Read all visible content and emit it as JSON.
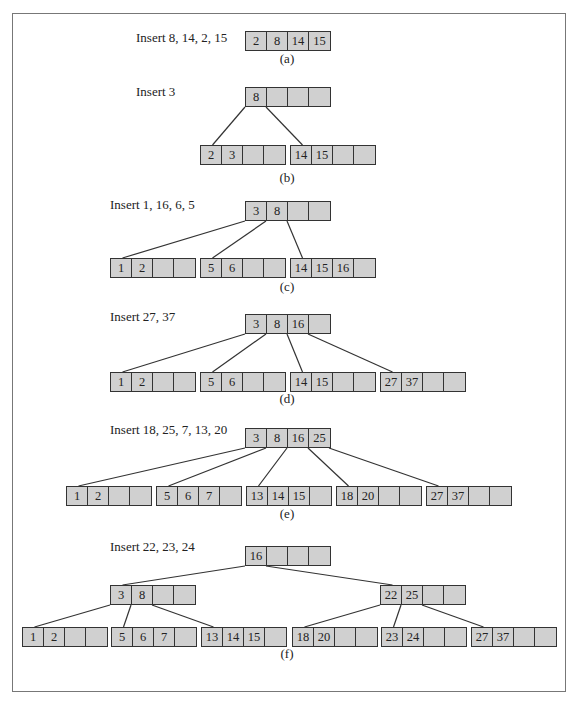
{
  "figure": {
    "panels": [
      {
        "id": "a",
        "caption": "(a)",
        "label": "Insert 8, 14, 2, 15",
        "label_pos": [
          136,
          37
        ],
        "caption_pos": [
          287,
          55
        ],
        "nodes": [
          {
            "id": "a_root",
            "x": 245,
            "y": 31,
            "keys": [
              "2",
              "8",
              "14",
              "15"
            ]
          }
        ],
        "edges": []
      },
      {
        "id": "b",
        "caption": "(b)",
        "label": "Insert 3",
        "label_pos": [
          136,
          91
        ],
        "caption_pos": [
          287,
          174
        ],
        "nodes": [
          {
            "id": "b_root",
            "x": 245,
            "y": 87,
            "keys": [
              "8",
              "",
              "",
              ""
            ]
          },
          {
            "id": "b_l",
            "x": 200,
            "y": 145,
            "keys": [
              "2",
              "3",
              "",
              ""
            ]
          },
          {
            "id": "b_r",
            "x": 290,
            "y": 145,
            "keys": [
              "14",
              "15",
              "",
              ""
            ]
          }
        ],
        "edges": [
          [
            "b_root",
            0,
            "b_l"
          ],
          [
            "b_root",
            1,
            "b_r"
          ]
        ]
      },
      {
        "id": "c",
        "caption": "(c)",
        "label": "Insert 1, 16, 6, 5",
        "label_pos": [
          110,
          204
        ],
        "caption_pos": [
          287,
          283
        ],
        "nodes": [
          {
            "id": "c_root",
            "x": 245,
            "y": 201,
            "keys": [
              "3",
              "8",
              "",
              ""
            ]
          },
          {
            "id": "c_0",
            "x": 110,
            "y": 258,
            "keys": [
              "1",
              "2",
              "",
              ""
            ]
          },
          {
            "id": "c_1",
            "x": 200,
            "y": 258,
            "keys": [
              "5",
              "6",
              "",
              ""
            ]
          },
          {
            "id": "c_2",
            "x": 290,
            "y": 258,
            "keys": [
              "14",
              "15",
              "16",
              ""
            ]
          }
        ],
        "edges": [
          [
            "c_root",
            0,
            "c_0"
          ],
          [
            "c_root",
            1,
            "c_1"
          ],
          [
            "c_root",
            2,
            "c_2"
          ]
        ]
      },
      {
        "id": "d",
        "caption": "(d)",
        "label": "Insert 27, 37",
        "label_pos": [
          110,
          316
        ],
        "caption_pos": [
          287,
          395
        ],
        "nodes": [
          {
            "id": "d_root",
            "x": 245,
            "y": 314,
            "keys": [
              "3",
              "8",
              "16",
              ""
            ]
          },
          {
            "id": "d_0",
            "x": 110,
            "y": 372,
            "keys": [
              "1",
              "2",
              "",
              ""
            ]
          },
          {
            "id": "d_1",
            "x": 200,
            "y": 372,
            "keys": [
              "5",
              "6",
              "",
              ""
            ]
          },
          {
            "id": "d_2",
            "x": 290,
            "y": 372,
            "keys": [
              "14",
              "15",
              "",
              ""
            ]
          },
          {
            "id": "d_3",
            "x": 380,
            "y": 372,
            "keys": [
              "27",
              "37",
              "",
              ""
            ]
          }
        ],
        "edges": [
          [
            "d_root",
            0,
            "d_0"
          ],
          [
            "d_root",
            1,
            "d_1"
          ],
          [
            "d_root",
            2,
            "d_2"
          ],
          [
            "d_root",
            3,
            "d_3"
          ]
        ]
      },
      {
        "id": "e",
        "caption": "(e)",
        "label": "Insert 18, 25, 7, 13, 20",
        "label_pos": [
          110,
          429
        ],
        "caption_pos": [
          287,
          510
        ],
        "nodes": [
          {
            "id": "e_root",
            "x": 245,
            "y": 428,
            "keys": [
              "3",
              "8",
              "16",
              "25"
            ]
          },
          {
            "id": "e_0",
            "x": 66,
            "y": 486,
            "keys": [
              "1",
              "2",
              "",
              ""
            ]
          },
          {
            "id": "e_1",
            "x": 156,
            "y": 486,
            "keys": [
              "5",
              "6",
              "7",
              ""
            ]
          },
          {
            "id": "e_2",
            "x": 246,
            "y": 486,
            "keys": [
              "13",
              "14",
              "15",
              ""
            ]
          },
          {
            "id": "e_3",
            "x": 336,
            "y": 486,
            "keys": [
              "18",
              "20",
              "",
              ""
            ]
          },
          {
            "id": "e_4",
            "x": 426,
            "y": 486,
            "keys": [
              "27",
              "37",
              "",
              ""
            ]
          }
        ],
        "edges": [
          [
            "e_root",
            0,
            "e_0"
          ],
          [
            "e_root",
            1,
            "e_1"
          ],
          [
            "e_root",
            2,
            "e_2"
          ],
          [
            "e_root",
            3,
            "e_3"
          ],
          [
            "e_root",
            4,
            "e_4"
          ]
        ]
      },
      {
        "id": "f",
        "caption": "(f)",
        "label": "Insert 22, 23, 24",
        "label_pos": [
          110,
          546
        ],
        "caption_pos": [
          287,
          650
        ],
        "nodes": [
          {
            "id": "f_root",
            "x": 245,
            "y": 546,
            "keys": [
              "16",
              "",
              "",
              ""
            ]
          },
          {
            "id": "f_L",
            "x": 110,
            "y": 585,
            "keys": [
              "3",
              "8",
              "",
              ""
            ]
          },
          {
            "id": "f_R",
            "x": 380,
            "y": 585,
            "keys": [
              "22",
              "25",
              "",
              ""
            ]
          },
          {
            "id": "f_0",
            "x": 22,
            "y": 627,
            "keys": [
              "1",
              "2",
              "",
              ""
            ]
          },
          {
            "id": "f_1",
            "x": 111,
            "y": 627,
            "keys": [
              "5",
              "6",
              "7",
              ""
            ]
          },
          {
            "id": "f_2",
            "x": 201,
            "y": 627,
            "keys": [
              "13",
              "14",
              "15",
              ""
            ]
          },
          {
            "id": "f_3",
            "x": 292,
            "y": 627,
            "keys": [
              "18",
              "20",
              "",
              ""
            ]
          },
          {
            "id": "f_4",
            "x": 381,
            "y": 627,
            "keys": [
              "23",
              "24",
              "",
              ""
            ]
          },
          {
            "id": "f_5",
            "x": 471,
            "y": 627,
            "keys": [
              "27",
              "37",
              "",
              ""
            ]
          }
        ],
        "edges": [
          [
            "f_root",
            0,
            "f_L"
          ],
          [
            "f_root",
            1,
            "f_R"
          ],
          [
            "f_L",
            0,
            "f_0"
          ],
          [
            "f_L",
            1,
            "f_1"
          ],
          [
            "f_L",
            2,
            "f_2"
          ],
          [
            "f_R",
            0,
            "f_3"
          ],
          [
            "f_R",
            1,
            "f_4"
          ],
          [
            "f_R",
            2,
            "f_5"
          ]
        ]
      }
    ]
  },
  "style": {
    "node_fill": "#d0d0d0",
    "line": "#333333",
    "frame": "#777777",
    "cell_width": 21,
    "cell_height": 20
  }
}
